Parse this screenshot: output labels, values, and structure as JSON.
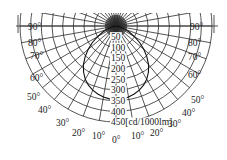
{
  "chart_data": {
    "type": "polar",
    "title": "",
    "unit_label": "[cd/1000lm]",
    "radial_ticks": [
      50,
      100,
      150,
      200,
      250,
      300,
      350,
      400,
      450
    ],
    "radial_max": 450,
    "angle_ticks_left": [
      "90°",
      "80°",
      "70°",
      "60°",
      "50°",
      "40°",
      "30°",
      "20°",
      "10°"
    ],
    "angle_ticks_right": [
      "90°",
      "80°",
      "70°",
      "60°",
      "50°",
      "40°",
      "30°",
      "20°",
      "10°"
    ],
    "angle_tick_bottom": "0°",
    "angle_step_deg": 10,
    "series": [
      {
        "name": "C0-C180",
        "angles_deg": [
          0,
          5,
          10,
          15,
          20,
          25,
          30,
          35,
          40,
          45,
          50,
          55,
          60,
          65,
          70,
          75,
          80,
          85,
          90
        ],
        "values": [
          345,
          343,
          338,
          330,
          320,
          306,
          288,
          265,
          238,
          205,
          170,
          135,
          100,
          70,
          45,
          25,
          12,
          4,
          0
        ]
      }
    ],
    "grid": true
  }
}
